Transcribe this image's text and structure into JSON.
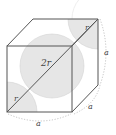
{
  "diagram": {
    "labels": {
      "center_diameter": "2r",
      "radius_top": "r",
      "radius_bottom": "r",
      "edge_right": "a",
      "edge_depth": "a",
      "edge_bottom": "a"
    },
    "colors": {
      "edge": "#555555",
      "sphere_fill": "#e6e6e6",
      "sphere_stroke": "#cfcfcf",
      "dotted": "#b5b5b5",
      "label": "#444444"
    }
  }
}
